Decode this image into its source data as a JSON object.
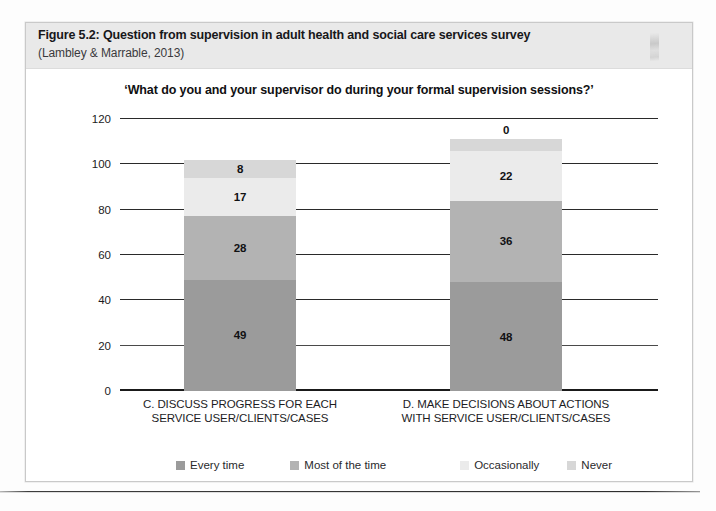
{
  "figure": {
    "title": "Figure 5.2: Question from supervision in adult health and social care services survey",
    "citation": "(Lambley & Marrable, 2013)"
  },
  "chart_data": {
    "type": "bar",
    "subtype": "stacked-vertical",
    "title": "‘What do you and your supervisor do during your formal supervision sessions?’",
    "xlabel": "",
    "ylabel": "",
    "ylim": [
      0,
      120
    ],
    "ytick_step": 20,
    "yticks": [
      "120",
      "100",
      "80",
      "60",
      "40",
      "20",
      "0"
    ],
    "grid": true,
    "legend_position": "bottom",
    "categories": [
      "C. DISCUSS PROGRESS FOR EACH SERVICE USER/CLIENTS/CASES",
      "D. MAKE DECISIONS ABOUT ACTIONS WITH SERVICE USER/CLIENTS/CASES"
    ],
    "category_lines": [
      [
        "C. DISCUSS PROGRESS FOR EACH",
        "SERVICE USER/CLIENTS/CASES"
      ],
      [
        "D. MAKE DECISIONS ABOUT ACTIONS",
        "WITH SERVICE USER/CLIENTS/CASES"
      ]
    ],
    "series": [
      {
        "name": "Every time",
        "color": "#9b9b9b",
        "values": [
          49,
          48
        ]
      },
      {
        "name": "Most of the time",
        "color": "#b3b3b3",
        "values": [
          28,
          36
        ]
      },
      {
        "name": "Occasionally",
        "color": "#ebebeb",
        "values": [
          17,
          22
        ]
      },
      {
        "name": "Never",
        "color": "#d7d7d7",
        "values": [
          8,
          0
        ]
      }
    ],
    "totals": [
      102,
      106
    ]
  }
}
